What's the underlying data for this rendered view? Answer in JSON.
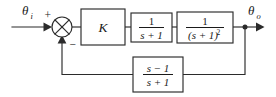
{
  "diagram": {
    "type": "control-system-block-diagram",
    "background_color": "#ffffff",
    "line_color": "#2b2b2b",
    "text_color": "#1a1a1a",
    "signals": {
      "input_label_base": "θ",
      "input_label_sub": "i",
      "output_label_base": "θ",
      "output_label_sub": "o"
    },
    "summing_junction": {
      "name": "summing-junction",
      "style": "circle-with-cross",
      "plus_sign": "+",
      "minus_sign": "−",
      "cx": 62,
      "cy": 27,
      "r": 10
    },
    "blocks": [
      {
        "id": "gain-block",
        "label": "K",
        "kind": "scalar",
        "numerator": "K",
        "denominator": "",
        "x": 81,
        "y": 9,
        "w": 44,
        "h": 36
      },
      {
        "id": "first-order-block",
        "label": "1/(s + 1)",
        "kind": "fraction",
        "numerator": "1",
        "denominator": "s + 1",
        "x": 131,
        "y": 13,
        "w": 41,
        "h": 29
      },
      {
        "id": "second-order-block",
        "label": "1/(s + 1)^2",
        "kind": "fraction",
        "numerator": "1",
        "denominator": "(s + 1)",
        "denominator_exponent": "2",
        "x": 177,
        "y": 12,
        "w": 56,
        "h": 31
      },
      {
        "id": "feedback-block",
        "label": "(s - 1)/(s + 1)",
        "kind": "fraction",
        "numerator": "s − 1",
        "denominator": "s + 1",
        "x": 133,
        "y": 57,
        "w": 50,
        "h": 35
      }
    ],
    "nodes": [
      {
        "id": "output-takeoff-node",
        "x": 245,
        "y": 27
      }
    ],
    "wires": [
      {
        "id": "input-wire",
        "from": "input-source",
        "to": "summing-junction"
      },
      {
        "id": "error-wire",
        "from": "summing-junction",
        "to": "gain-block"
      },
      {
        "id": "gain-to-first-order-wire",
        "from": "gain-block",
        "to": "first-order-block"
      },
      {
        "id": "first-to-second-order-wire",
        "from": "first-order-block",
        "to": "second-order-block"
      },
      {
        "id": "output-wire",
        "from": "second-order-block",
        "to": "output-sink"
      },
      {
        "id": "feedback-down-wire",
        "from": "output-takeoff-node",
        "to": "feedback-block"
      },
      {
        "id": "feedback-return-wire",
        "from": "feedback-block",
        "to": "summing-junction"
      }
    ]
  }
}
